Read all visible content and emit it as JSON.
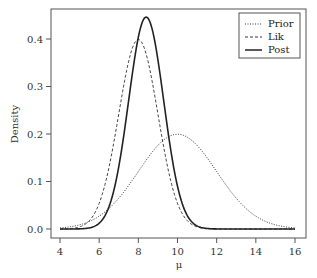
{
  "chart_data": {
    "type": "line",
    "title": "",
    "xlabel": "μ",
    "ylabel": "Density",
    "xlim": [
      4,
      16
    ],
    "ylim": [
      0,
      0.45
    ],
    "x_ticks": [
      "4",
      "6",
      "8",
      "10",
      "12",
      "14",
      "16"
    ],
    "y_ticks": [
      "0.0",
      "0.1",
      "0.2",
      "0.3",
      "0.4"
    ],
    "grid": false,
    "legend_position": "top-right",
    "series": [
      {
        "name": "Prior",
        "style": "dotted",
        "distribution": "normal",
        "mean": 10,
        "sd": 2,
        "peak": 0.199
      },
      {
        "name": "Lik",
        "style": "dashed",
        "distribution": "normal",
        "mean": 8,
        "sd": 1,
        "peak": 0.399
      },
      {
        "name": "Post",
        "style": "solid",
        "distribution": "normal",
        "mean": 8.4,
        "sd": 0.894,
        "peak": 0.446
      }
    ]
  },
  "legend": {
    "items": [
      {
        "label": "Prior"
      },
      {
        "label": "Lik"
      },
      {
        "label": "Post"
      }
    ]
  }
}
